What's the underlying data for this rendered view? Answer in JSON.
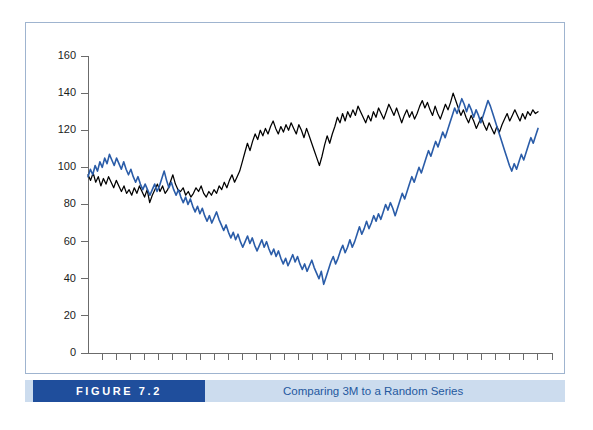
{
  "figure": {
    "tag_label": "FIGURE 7.2",
    "caption": "Comparing 3M to a Random Series",
    "tag_bg_color": "#1f4e9c",
    "caption_bar_color": "#ccdcee",
    "caption_text_color": "#24589e",
    "frame_border_color": "#9fb4cf"
  },
  "chart_data": {
    "type": "line",
    "title": "Comparing 3M to a Random Series",
    "xlabel": "",
    "ylabel": "",
    "xlim": [
      0,
      100
    ],
    "ylim": [
      0,
      160
    ],
    "ytick_labels": [
      "0",
      "20",
      "40",
      "60",
      "80",
      "100",
      "120",
      "140",
      "160"
    ],
    "yticks": [
      0,
      20,
      40,
      60,
      80,
      100,
      120,
      140,
      160
    ],
    "xticks_count": 33,
    "xtick_labels": [],
    "grid": false,
    "legend": null,
    "legend_position": "none",
    "series": [
      {
        "name": "3M",
        "color": "#000000",
        "values": [
          96,
          93,
          97,
          92,
          95,
          90,
          94,
          91,
          95,
          92,
          89,
          93,
          90,
          87,
          90,
          86,
          88,
          85,
          89,
          86,
          90,
          87,
          84,
          88,
          81,
          85,
          88,
          91,
          87,
          90,
          86,
          88,
          92,
          96,
          91,
          88,
          87,
          89,
          85,
          87,
          84,
          86,
          89,
          87,
          90,
          86,
          84,
          87,
          85,
          88,
          86,
          90,
          88,
          92,
          89,
          93,
          96,
          92,
          95,
          98,
          103,
          108,
          113,
          109,
          114,
          118,
          115,
          120,
          117,
          121,
          118,
          122,
          125,
          121,
          118,
          122,
          119,
          123,
          120,
          124,
          121,
          118,
          123,
          120,
          116,
          121,
          117,
          113,
          109,
          105,
          101,
          106,
          112,
          117,
          113,
          118,
          122,
          127,
          124,
          129,
          125,
          130,
          127,
          131,
          128,
          133,
          130,
          127,
          124,
          128,
          125,
          130,
          127,
          132,
          129,
          126,
          130,
          134,
          131,
          128,
          132,
          128,
          124,
          128,
          131,
          127,
          130,
          126,
          129,
          133,
          136,
          132,
          135,
          131,
          128,
          133,
          129,
          126,
          130,
          134,
          131,
          135,
          140,
          136,
          132,
          128,
          131,
          127,
          124,
          128,
          125,
          121,
          124,
          127,
          123,
          120,
          124,
          121,
          118,
          122,
          119,
          123,
          126,
          129,
          125,
          128,
          131,
          128,
          125,
          129,
          126,
          130,
          128,
          131,
          129,
          130
        ]
      },
      {
        "name": "Random Series",
        "color": "#2a5ca8",
        "values": [
          95,
          99,
          96,
          101,
          98,
          103,
          100,
          105,
          102,
          107,
          104,
          101,
          105,
          102,
          99,
          103,
          99,
          96,
          99,
          95,
          92,
          95,
          91,
          88,
          91,
          88,
          85,
          88,
          91,
          87,
          90,
          94,
          98,
          93,
          89,
          92,
          88,
          85,
          88,
          84,
          81,
          84,
          80,
          83,
          79,
          76,
          79,
          75,
          78,
          74,
          71,
          74,
          70,
          73,
          76,
          72,
          69,
          66,
          69,
          65,
          62,
          65,
          61,
          64,
          60,
          57,
          60,
          63,
          59,
          62,
          58,
          55,
          58,
          61,
          57,
          60,
          56,
          53,
          56,
          52,
          55,
          51,
          48,
          51,
          47,
          50,
          53,
          49,
          52,
          48,
          45,
          48,
          44,
          47,
          50,
          46,
          43,
          40,
          44,
          37,
          41,
          45,
          49,
          52,
          48,
          51,
          55,
          58,
          54,
          57,
          61,
          57,
          60,
          64,
          68,
          64,
          67,
          71,
          67,
          70,
          74,
          71,
          75,
          72,
          76,
          80,
          77,
          81,
          78,
          74,
          78,
          82,
          86,
          83,
          87,
          91,
          95,
          92,
          96,
          100,
          97,
          101,
          105,
          109,
          106,
          110,
          114,
          111,
          115,
          119,
          116,
          120,
          124,
          128,
          132,
          129,
          133,
          137,
          134,
          130,
          134,
          131,
          127,
          131,
          128,
          124,
          128,
          132,
          136,
          133,
          129,
          125,
          121,
          117,
          113,
          109,
          105,
          101,
          98,
          102,
          99,
          103,
          107,
          104,
          108,
          112,
          116,
          113,
          117,
          121
        ]
      }
    ]
  }
}
